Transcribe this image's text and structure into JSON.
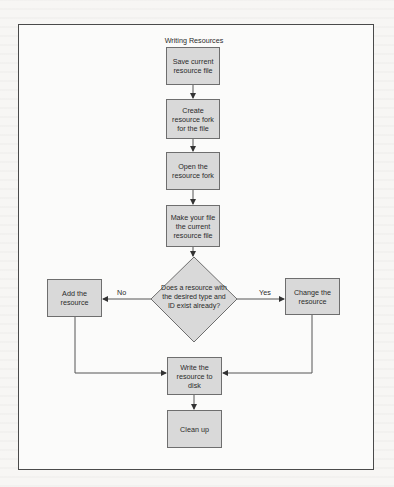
{
  "diagram": {
    "title": "Writing Resources",
    "colors": {
      "node_fill": "#d9d9d9",
      "node_border": "#6e6e6e",
      "line": "#555555",
      "frame": "#4a4a4a"
    },
    "nodes": {
      "save": "Save current resource file",
      "create": "Create resource fork for the file",
      "open": "Open the resource fork",
      "make_current": "Make your file the current resource file",
      "decision": "Does a resource with the desired type and ID exist already?",
      "add": "Add the resource",
      "change": "Change the resource",
      "write": "Write the resource to disk",
      "cleanup": "Clean up"
    },
    "edge_labels": {
      "no": "No",
      "yes": "Yes"
    }
  }
}
